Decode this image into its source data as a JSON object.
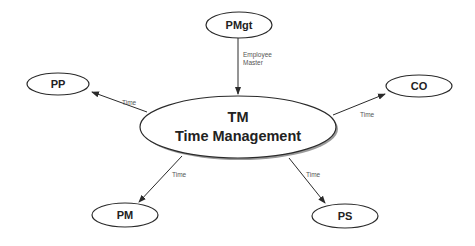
{
  "diagram": {
    "center": {
      "id": "TM",
      "line1": "TM",
      "line2": "Time Management"
    },
    "nodes": [
      {
        "id": "PMgt",
        "label": "PMgt"
      },
      {
        "id": "PP",
        "label": "PP"
      },
      {
        "id": "CO",
        "label": "CO"
      },
      {
        "id": "PM",
        "label": "PM"
      },
      {
        "id": "PS",
        "label": "PS"
      }
    ],
    "edges": [
      {
        "from": "PMgt",
        "to": "TM",
        "label_lines": [
          "Employee",
          "Master"
        ]
      },
      {
        "from": "TM",
        "to": "PP",
        "label_lines": [
          "Time"
        ]
      },
      {
        "from": "TM",
        "to": "CO",
        "label_lines": [
          "Time"
        ]
      },
      {
        "from": "TM",
        "to": "PM",
        "label_lines": [
          "Time"
        ]
      },
      {
        "from": "TM",
        "to": "PS",
        "label_lines": [
          "Time"
        ]
      }
    ]
  }
}
